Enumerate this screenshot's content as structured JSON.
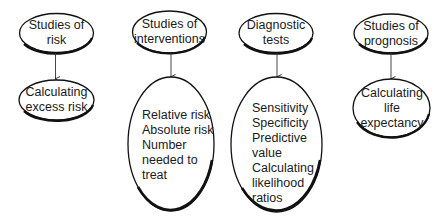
{
  "diagram": {
    "columns": [
      {
        "top": {
          "lines": [
            "Studies of",
            "risk"
          ]
        },
        "bottom": {
          "lines": [
            "Calculating",
            "excess risk"
          ]
        }
      },
      {
        "top": {
          "lines": [
            "Studies of",
            "interventions"
          ]
        },
        "bottom": {
          "lines": [
            "Relative risk",
            "Absolute risk",
            "Number",
            "needed to",
            "treat"
          ]
        }
      },
      {
        "top": {
          "lines": [
            "Diagnostic",
            "tests"
          ]
        },
        "bottom": {
          "lines": [
            "Sensitivity",
            "Specificity",
            "Predictive",
            "value",
            "Calculating",
            "likelihood",
            "ratios"
          ]
        }
      },
      {
        "top": {
          "lines": [
            "Studies of",
            "prognosis"
          ]
        },
        "bottom": {
          "lines": [
            "Calculating",
            "life",
            "expectancy"
          ]
        }
      }
    ],
    "colors": {
      "stroke": "#111111",
      "fill": "#ffffff",
      "text": "#1a1a1a"
    }
  }
}
